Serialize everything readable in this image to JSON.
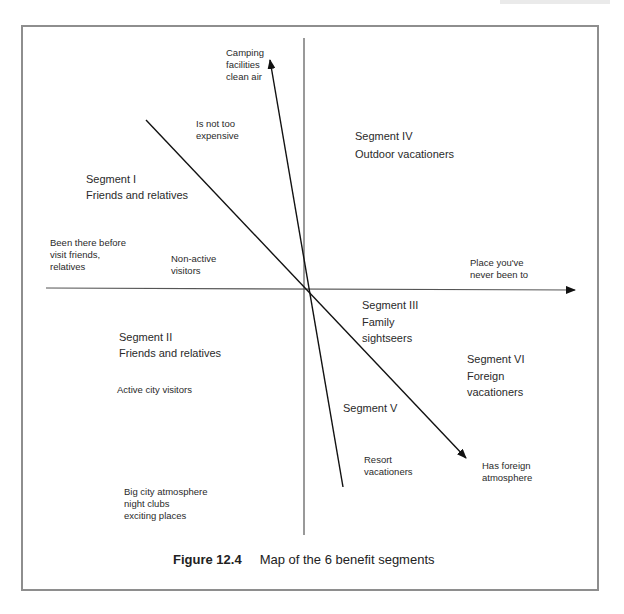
{
  "figure": {
    "number": "Figure 12.4",
    "title": "Map of the 6 benefit segments"
  },
  "axes": {
    "horizontal_right_label": "Place you've\nnever been to",
    "horizontal_left_label": "Been there before\nvisit friends,\nrelatives"
  },
  "vectors": {
    "camping": "Camping\nfacilities\nclean air",
    "not_expensive": "Is not too\nexpensive",
    "non_active": "Non-active\nvisitors",
    "active_city": "Active city visitors",
    "big_city": "Big city atmosphere\nnight clubs\nexciting places",
    "resort": "Resort\nvacationers",
    "foreign": "Has foreign\natmosphere"
  },
  "segments": [
    {
      "id": "I",
      "name": "Segment I",
      "desc": "Friends and relatives"
    },
    {
      "id": "II",
      "name": "Segment II",
      "desc": "Friends and relatives"
    },
    {
      "id": "III",
      "name": "Segment III",
      "desc": "Family\nsightseers"
    },
    {
      "id": "IV",
      "name": "Segment IV",
      "desc": "Outdoor vacationers"
    },
    {
      "id": "V",
      "name": "Segment V",
      "desc": ""
    },
    {
      "id": "VI",
      "name": "Segment VI",
      "desc": "Foreign\nvacationers"
    }
  ],
  "colors": {
    "frame": "#8e8e8e",
    "axis": "#555555",
    "vector": "#111111"
  }
}
